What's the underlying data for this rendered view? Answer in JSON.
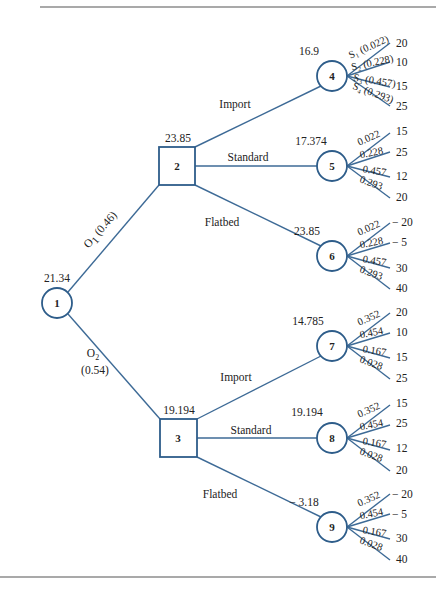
{
  "diagram": {
    "type": "decision-tree",
    "colors": {
      "line": "#3d6a96",
      "node_stroke": "#2e5d8a",
      "text": "#222222",
      "rule": "#555555"
    },
    "root": {
      "id": "1",
      "shape": "circle",
      "value": "21.34"
    },
    "branches_from_root": [
      {
        "label": "O",
        "sub": "1",
        "prob": "(0.46)",
        "to": "2"
      },
      {
        "label": "O",
        "sub": "2",
        "prob": "(0.54)",
        "to": "3"
      }
    ],
    "decision_nodes": [
      {
        "id": "2",
        "shape": "square",
        "value": "23.85",
        "options": [
          {
            "label": "Import",
            "to": "4"
          },
          {
            "label": "Standard",
            "to": "5"
          },
          {
            "label": "Flatbed",
            "to": "6"
          }
        ]
      },
      {
        "id": "3",
        "shape": "square",
        "value": "19.194",
        "options": [
          {
            "label": "Import",
            "to": "7"
          },
          {
            "label": "Standard",
            "to": "8"
          },
          {
            "label": "Flatbed",
            "to": "9"
          }
        ]
      }
    ],
    "chance_nodes": [
      {
        "id": "4",
        "value": "16.9",
        "outcomes": [
          {
            "label": "S₁ (0.022)",
            "payoff": "20"
          },
          {
            "label": "S₂ (0.228)",
            "payoff": "10"
          },
          {
            "label": "S₃ (0.457)",
            "payoff": "15"
          },
          {
            "label": "S₄ (0.293)",
            "payoff": "25"
          }
        ]
      },
      {
        "id": "5",
        "value": "17.374",
        "outcomes": [
          {
            "label": "0.022",
            "payoff": "15"
          },
          {
            "label": "0.228",
            "payoff": "25"
          },
          {
            "label": "0.457",
            "payoff": "12"
          },
          {
            "label": "0.293",
            "payoff": "20"
          }
        ]
      },
      {
        "id": "6",
        "value": "23.85",
        "outcomes": [
          {
            "label": "0.022",
            "payoff": "− 20"
          },
          {
            "label": "0.228",
            "payoff": "− 5"
          },
          {
            "label": "0.457",
            "payoff": "30"
          },
          {
            "label": "0.293",
            "payoff": "40"
          }
        ]
      },
      {
        "id": "7",
        "value": "14.785",
        "outcomes": [
          {
            "label": "0.352",
            "payoff": "20"
          },
          {
            "label": "0.454",
            "payoff": "10"
          },
          {
            "label": "0.167",
            "payoff": "15"
          },
          {
            "label": "0.028",
            "payoff": "25"
          }
        ]
      },
      {
        "id": "8",
        "value": "19.194",
        "outcomes": [
          {
            "label": "0.352",
            "payoff": "15"
          },
          {
            "label": "0.454",
            "payoff": "25"
          },
          {
            "label": "0.167",
            "payoff": "12"
          },
          {
            "label": "0.028",
            "payoff": "20"
          }
        ]
      },
      {
        "id": "9",
        "value": "− 3.18",
        "outcomes": [
          {
            "label": "0.352",
            "payoff": "− 20"
          },
          {
            "label": "0.454",
            "payoff": "− 5"
          },
          {
            "label": "0.167",
            "payoff": "30"
          },
          {
            "label": "0.028",
            "payoff": "40"
          }
        ]
      }
    ]
  }
}
